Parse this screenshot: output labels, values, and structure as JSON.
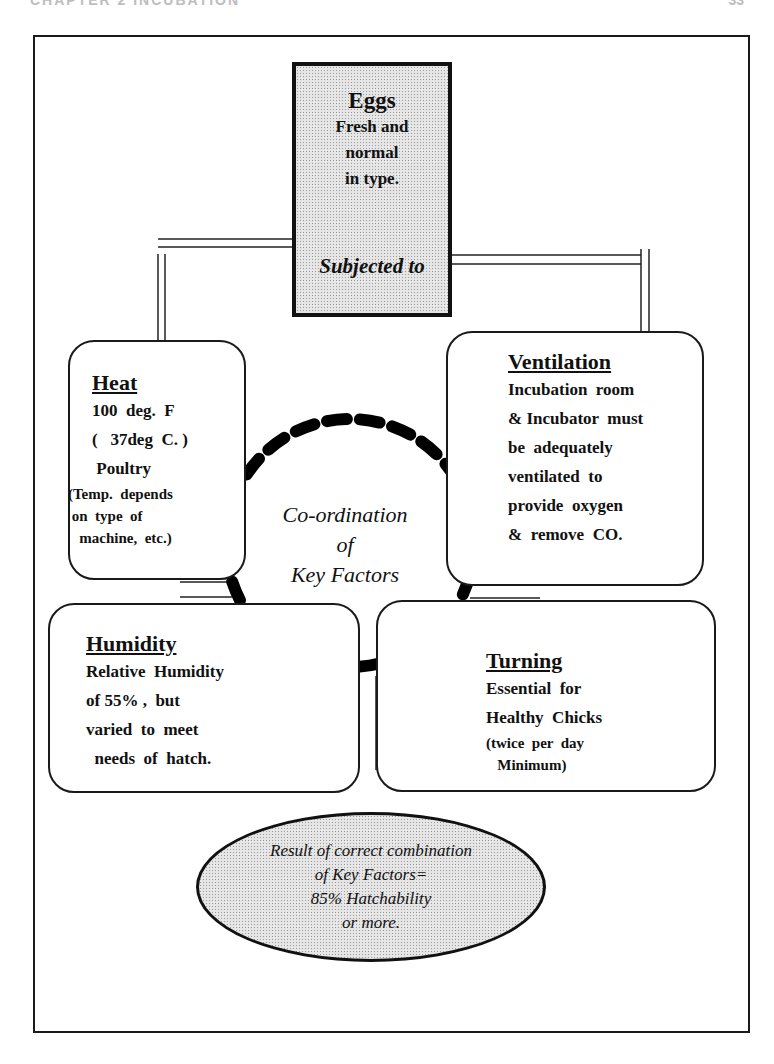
{
  "running_head": {
    "left": "CHAPTER 2 INCUBATION",
    "right": "33"
  },
  "eggs": {
    "title": "Eggs",
    "lines": [
      "Fresh and",
      "normal",
      "in type."
    ],
    "subjected": "Subjected to"
  },
  "center": {
    "lines": [
      "Co-ordination",
      "of",
      "Key  Factors"
    ]
  },
  "factors": {
    "heat": {
      "title": "Heat",
      "lines": [
        "100  deg.  F",
        "(   37deg  C. )",
        " Poultry"
      ],
      "small": [
        "(Temp.  depends",
        " on  type  of",
        "   machine,  etc.)"
      ]
    },
    "ventilation": {
      "title": "Ventilation",
      "lines": [
        "Incubation  room",
        "& Incubator  must",
        "be  adequately",
        "ventilated  to",
        "provide  oxygen",
        "&  remove  CO."
      ]
    },
    "humidity": {
      "title": "Humidity",
      "lines": [
        "Relative  Humidity",
        "of 55% ,  but",
        "varied  to  meet",
        "  needs  of  hatch."
      ]
    },
    "turning": {
      "title": "Turning",
      "lines": [
        "Essential  for",
        "Healthy  Chicks"
      ],
      "small": [
        "(twice  per  day",
        "   Minimum)"
      ]
    }
  },
  "result": {
    "lines": [
      "Result  of  correct  combination",
      "of  Key  Factors=",
      "85%  Hatchability",
      "or  more."
    ]
  },
  "colors": {
    "ink": "#111111",
    "stipple_fill": "#e6e6e6"
  }
}
